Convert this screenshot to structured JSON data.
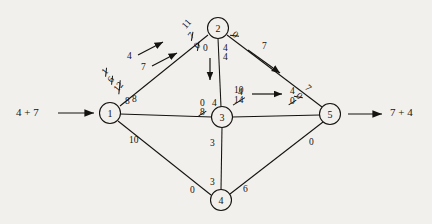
{
  "diagram": {
    "nodes": [
      {
        "id": "1",
        "label": "1",
        "x": 110,
        "y": 113
      },
      {
        "id": "2",
        "label": "2",
        "x": 218,
        "y": 28
      },
      {
        "id": "3",
        "label": "3",
        "x": 222,
        "y": 117
      },
      {
        "id": "4",
        "label": "4",
        "x": 221,
        "y": 200
      },
      {
        "id": "5",
        "label": "5",
        "x": 330,
        "y": 114
      }
    ],
    "source_flow": "4 + 7",
    "sink_flow": "7 + 4",
    "augment_arrow_labels": {
      "path_a": "4",
      "path_b": "7",
      "path_c": "7",
      "path_d": "4"
    },
    "edge_labels": {
      "e12_stack": [
        "1",
        "6",
        "12",
        "8"
      ],
      "e12_struck": [
        true,
        true,
        true,
        false
      ],
      "e2_top_stack": [
        "11",
        "7",
        "0"
      ],
      "e2_top_struck": [
        false,
        true,
        true
      ],
      "e25_near2": "0",
      "e25_near2_struck": true,
      "e25_near5_top": "7",
      "e25_near5_bot": "0",
      "e25_near5_bot_struck": true,
      "e23_top": "0",
      "e23_top2": "4",
      "e23_bot": "4",
      "e13_top": "8",
      "e13_stack_top": "0",
      "e13_stack_bot": "8",
      "e13_stack_bot_struck": true,
      "e35_top": "10",
      "e35_bot": "14",
      "e35_bot_struck": true,
      "e35_right_top": "4",
      "e35_right_bot": "0",
      "e35_right_bot_struck": true,
      "e14_label": "10",
      "e34_top": "3",
      "e34_bot": "3",
      "e45_left": "0",
      "e45_right": "6",
      "e45_to5": "0"
    }
  }
}
